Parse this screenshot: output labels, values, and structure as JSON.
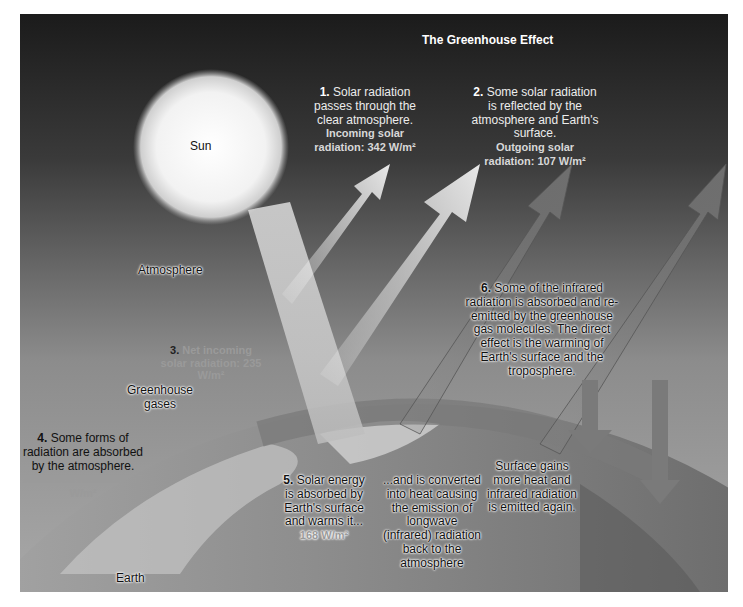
{
  "figure": {
    "title": "The Greenhouse Effect",
    "labels": {
      "sun": "Sun",
      "atmosphere": "Atmosphere",
      "greenhouse_gases": "Greenhouse gases",
      "earth": "Earth"
    },
    "steps": [
      {
        "num": "1.",
        "text": "Solar radiation passes through the clear atmosphere.",
        "metric": "Incoming solar radiation: 342 W/m²"
      },
      {
        "num": "2.",
        "text": "Some solar radiation is reflected by the atmosphere and Earth's surface.",
        "metric": "Outgoing solar radiation: 107 W/m²"
      },
      {
        "num": "3.",
        "text": "",
        "metric": "Net incoming solar radiation: 235 W/m²"
      },
      {
        "num": "4.",
        "text": "Some forms of radiation are absorbed by the atmosphere.",
        "metric": "Absorbed radiation: 67 W/m²"
      },
      {
        "num": "5.",
        "text": "Solar energy is absorbed by Earth's surface and warms it...",
        "metric": "168 W/m²"
      },
      {
        "num": "6.",
        "text": "Some of the infrared radiation is absorbed and re-emitted by the greenhouse gas molecules.  The direct effect is the warming of Earth's surface and the troposphere.",
        "metric": ""
      }
    ],
    "converted_text": "...and is converted into heat causing the emission of longwave (infrared) radiation back to the atmosphere",
    "surface_gains_text": "Surface gains more heat and infrared radiation is emitted again."
  }
}
